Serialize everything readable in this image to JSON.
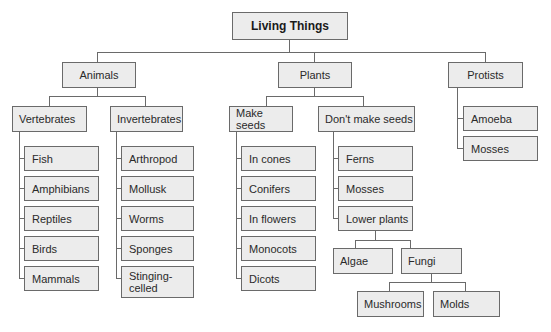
{
  "diagram": {
    "title": "Living Things",
    "root": {
      "label": "Living Things",
      "children": [
        {
          "label": "Animals",
          "children": [
            {
              "label": "Vertebrates",
              "children": [
                "Fish",
                "Amphibians",
                "Reptiles",
                "Birds",
                "Mammals"
              ]
            },
            {
              "label": "Invertebrates",
              "children": [
                "Arthropod",
                "Mollusk",
                "Worms",
                "Sponges",
                "Stinging-celled"
              ]
            }
          ]
        },
        {
          "label": "Plants",
          "children": [
            {
              "label": "Make seeds",
              "children": [
                "In cones",
                "Conifers",
                "In flowers",
                "Monocots",
                "Dicots"
              ]
            },
            {
              "label": "Don't make seeds",
              "children": [
                "Ferns",
                "Mosses",
                {
                  "label": "Lower plants",
                  "children": [
                    "Algae",
                    {
                      "label": "Fungi",
                      "children": [
                        "Mushrooms",
                        "Molds"
                      ]
                    }
                  ]
                }
              ]
            }
          ]
        },
        {
          "label": "Protists",
          "children": [
            "Amoeba",
            "Mosses"
          ]
        }
      ]
    }
  },
  "labels": {
    "root": "Living Things",
    "animals": "Animals",
    "plants": "Plants",
    "protists": "Protists",
    "vertebrates": "Vertebrates",
    "invertebrates": "Invertebrates",
    "make_seeds": "Make seeds",
    "dont_make_seeds": "Don't make seeds",
    "vertebrate_items": [
      "Fish",
      "Amphibians",
      "Reptiles",
      "Birds",
      "Mammals"
    ],
    "invertebrate_items": [
      "Arthropod",
      "Mollusk",
      "Worms",
      "Sponges",
      "Stinging-\ncelled"
    ],
    "seed_items": [
      "In cones",
      "Conifers",
      "In flowers",
      "Monocots",
      "Dicots"
    ],
    "nonseed_items": [
      "Ferns",
      "Mosses",
      "Lower plants"
    ],
    "lower_plants_items": [
      "Algae",
      "Fungi"
    ],
    "fungi_items": [
      "Mushrooms",
      "Molds"
    ],
    "protist_items": [
      "Amoeba",
      "Mosses"
    ]
  },
  "colors": {
    "box_fill": "#ececec",
    "box_border": "#6a6a6a",
    "line": "#6a6a6a",
    "text": "#2a2a2a"
  }
}
